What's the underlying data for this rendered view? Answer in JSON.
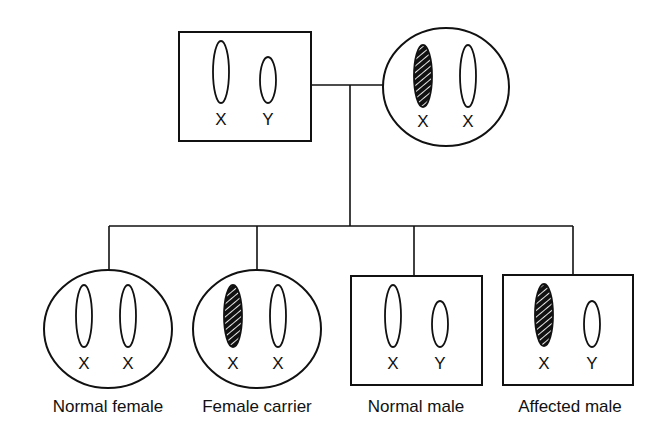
{
  "diagram": {
    "type": "pedigree",
    "colors": {
      "line": "#111111",
      "affected_fill": "#111111",
      "hatch": "#ffffff",
      "background": "#ffffff"
    },
    "parents": {
      "father": {
        "shape": "square",
        "chromosomes": [
          {
            "label": "X",
            "affected": false
          },
          {
            "label": "Y",
            "affected": false
          }
        ]
      },
      "mother": {
        "shape": "circle",
        "chromosomes": [
          {
            "label": "X",
            "affected": true
          },
          {
            "label": "X",
            "affected": false
          }
        ]
      }
    },
    "children": [
      {
        "caption": "Normal female",
        "shape": "circle",
        "chromosomes": [
          {
            "label": "X",
            "affected": false
          },
          {
            "label": "X",
            "affected": false
          }
        ]
      },
      {
        "caption": "Female carrier",
        "shape": "circle",
        "chromosomes": [
          {
            "label": "X",
            "affected": true
          },
          {
            "label": "X",
            "affected": false
          }
        ]
      },
      {
        "caption": "Normal male",
        "shape": "square",
        "chromosomes": [
          {
            "label": "X",
            "affected": false
          },
          {
            "label": "Y",
            "affected": false
          }
        ]
      },
      {
        "caption": "Affected male",
        "shape": "square",
        "chromosomes": [
          {
            "label": "X",
            "affected": true
          },
          {
            "label": "Y",
            "affected": false
          }
        ]
      }
    ]
  }
}
